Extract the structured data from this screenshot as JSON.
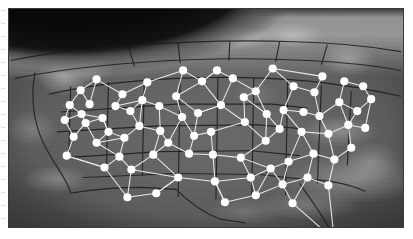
{
  "figure": {
    "kind": "satellite-map-with-network-overlay",
    "frame": {
      "x": 8,
      "y": 8,
      "width": 396,
      "height": 220,
      "border_color": "#3a3a3a"
    },
    "basemap": {
      "style": "grayscale satellite photo of North America on the curved globe limb",
      "space_color": "#0a0a0a",
      "ocean_color": "#3f3f3f",
      "land_color": "#646464",
      "snow_cloud_color": "#d8d8d8",
      "border_line_color": "#1c1c1c",
      "has_state_boundaries": true,
      "has_country_boundaries": true
    },
    "overlay": {
      "node_color": "#ffffff",
      "node_radius": 4.1,
      "link_color": "#f2f2f2",
      "link_width": 1.05,
      "node_count": 78,
      "link_count": 118
    }
  },
  "chart_data": {
    "type": "scatter",
    "title": "",
    "xlabel": "",
    "ylabel": "",
    "xlim": [
      0,
      396
    ],
    "ylim": [
      0,
      220
    ],
    "grid": false,
    "legend": "none",
    "nodes": [
      {
        "id": 0,
        "x": 170,
        "y": 170
      },
      {
        "id": 1,
        "x": 207,
        "y": 174
      },
      {
        "id": 2,
        "x": 148,
        "y": 186
      },
      {
        "id": 3,
        "x": 119,
        "y": 190
      },
      {
        "id": 4,
        "x": 123,
        "y": 162
      },
      {
        "id": 5,
        "x": 145,
        "y": 147
      },
      {
        "id": 6,
        "x": 111,
        "y": 149
      },
      {
        "id": 7,
        "x": 96,
        "y": 160
      },
      {
        "id": 8,
        "x": 88,
        "y": 135
      },
      {
        "id": 9,
        "x": 116,
        "y": 130
      },
      {
        "id": 10,
        "x": 131,
        "y": 118
      },
      {
        "id": 11,
        "x": 152,
        "y": 123
      },
      {
        "id": 12,
        "x": 151,
        "y": 98
      },
      {
        "id": 13,
        "x": 174,
        "y": 109
      },
      {
        "id": 14,
        "x": 203,
        "y": 124
      },
      {
        "id": 15,
        "x": 205,
        "y": 147
      },
      {
        "id": 16,
        "x": 233,
        "y": 150
      },
      {
        "id": 17,
        "x": 243,
        "y": 170
      },
      {
        "id": 18,
        "x": 217,
        "y": 195
      },
      {
        "id": 19,
        "x": 248,
        "y": 188
      },
      {
        "id": 20,
        "x": 275,
        "y": 177
      },
      {
        "id": 21,
        "x": 281,
        "y": 154
      },
      {
        "id": 22,
        "x": 258,
        "y": 133
      },
      {
        "id": 23,
        "x": 237,
        "y": 114
      },
      {
        "id": 24,
        "x": 213,
        "y": 97
      },
      {
        "id": 25,
        "x": 194,
        "y": 73
      },
      {
        "id": 26,
        "x": 175,
        "y": 62
      },
      {
        "id": 27,
        "x": 139,
        "y": 74
      },
      {
        "id": 28,
        "x": 114,
        "y": 86
      },
      {
        "id": 29,
        "x": 94,
        "y": 110
      },
      {
        "id": 30,
        "x": 77,
        "y": 115
      },
      {
        "id": 31,
        "x": 65,
        "y": 129
      },
      {
        "id": 32,
        "x": 58,
        "y": 148
      },
      {
        "id": 33,
        "x": 72,
        "y": 82
      },
      {
        "id": 34,
        "x": 88,
        "y": 71
      },
      {
        "id": 35,
        "x": 61,
        "y": 97
      },
      {
        "id": 36,
        "x": 73,
        "y": 106
      },
      {
        "id": 37,
        "x": 107,
        "y": 98
      },
      {
        "id": 38,
        "x": 122,
        "y": 103
      },
      {
        "id": 39,
        "x": 168,
        "y": 88
      },
      {
        "id": 40,
        "x": 190,
        "y": 105
      },
      {
        "id": 41,
        "x": 225,
        "y": 70
      },
      {
        "id": 42,
        "x": 248,
        "y": 83
      },
      {
        "id": 43,
        "x": 265,
        "y": 60
      },
      {
        "id": 44,
        "x": 286,
        "y": 78
      },
      {
        "id": 45,
        "x": 276,
        "y": 102
      },
      {
        "id": 46,
        "x": 294,
        "y": 124
      },
      {
        "id": 47,
        "x": 312,
        "y": 108
      },
      {
        "id": 48,
        "x": 307,
        "y": 84
      },
      {
        "id": 49,
        "x": 332,
        "y": 94
      },
      {
        "id": 50,
        "x": 350,
        "y": 103
      },
      {
        "id": 51,
        "x": 364,
        "y": 91
      },
      {
        "id": 52,
        "x": 356,
        "y": 78
      },
      {
        "id": 53,
        "x": 337,
        "y": 73
      },
      {
        "id": 54,
        "x": 321,
        "y": 126
      },
      {
        "id": 55,
        "x": 341,
        "y": 117
      },
      {
        "id": 56,
        "x": 358,
        "y": 120
      },
      {
        "id": 57,
        "x": 306,
        "y": 146
      },
      {
        "id": 58,
        "x": 327,
        "y": 152
      },
      {
        "id": 59,
        "x": 344,
        "y": 140
      },
      {
        "id": 60,
        "x": 300,
        "y": 170
      },
      {
        "id": 61,
        "x": 321,
        "y": 178
      },
      {
        "id": 62,
        "x": 285,
        "y": 196
      },
      {
        "id": 63,
        "x": 327,
        "y": 233
      },
      {
        "id": 64,
        "x": 259,
        "y": 106
      },
      {
        "id": 65,
        "x": 236,
        "y": 89
      },
      {
        "id": 66,
        "x": 209,
        "y": 62
      },
      {
        "id": 67,
        "x": 160,
        "y": 135
      },
      {
        "id": 68,
        "x": 181,
        "y": 146
      },
      {
        "id": 69,
        "x": 186,
        "y": 128
      },
      {
        "id": 70,
        "x": 100,
        "y": 124
      },
      {
        "id": 71,
        "x": 134,
        "y": 92
      },
      {
        "id": 72,
        "x": 56,
        "y": 112
      },
      {
        "id": 73,
        "x": 81,
        "y": 96
      },
      {
        "id": 74,
        "x": 296,
        "y": 104
      },
      {
        "id": 75,
        "x": 315,
        "y": 68
      },
      {
        "id": 76,
        "x": 272,
        "y": 121
      },
      {
        "id": 77,
        "x": 263,
        "y": 161
      }
    ],
    "links": [
      [
        0,
        1
      ],
      [
        0,
        2
      ],
      [
        0,
        5
      ],
      [
        0,
        4
      ],
      [
        1,
        15
      ],
      [
        1,
        17
      ],
      [
        1,
        18
      ],
      [
        2,
        3
      ],
      [
        2,
        0
      ],
      [
        3,
        4
      ],
      [
        3,
        7
      ],
      [
        4,
        5
      ],
      [
        4,
        6
      ],
      [
        5,
        11
      ],
      [
        5,
        67
      ],
      [
        6,
        7
      ],
      [
        6,
        9
      ],
      [
        6,
        8
      ],
      [
        7,
        32
      ],
      [
        8,
        9
      ],
      [
        8,
        30
      ],
      [
        8,
        70
      ],
      [
        9,
        10
      ],
      [
        9,
        70
      ],
      [
        10,
        11
      ],
      [
        10,
        38
      ],
      [
        10,
        71
      ],
      [
        11,
        67
      ],
      [
        11,
        12
      ],
      [
        12,
        13
      ],
      [
        12,
        71
      ],
      [
        13,
        67
      ],
      [
        13,
        69
      ],
      [
        13,
        39
      ],
      [
        14,
        15
      ],
      [
        14,
        69
      ],
      [
        14,
        23
      ],
      [
        15,
        16
      ],
      [
        15,
        68
      ],
      [
        16,
        17
      ],
      [
        16,
        22
      ],
      [
        16,
        77
      ],
      [
        17,
        19
      ],
      [
        17,
        77
      ],
      [
        18,
        19
      ],
      [
        18,
        1
      ],
      [
        19,
        20
      ],
      [
        19,
        77
      ],
      [
        20,
        21
      ],
      [
        20,
        62
      ],
      [
        20,
        60
      ],
      [
        21,
        77
      ],
      [
        21,
        57
      ],
      [
        21,
        46
      ],
      [
        22,
        23
      ],
      [
        22,
        76
      ],
      [
        22,
        64
      ],
      [
        23,
        24
      ],
      [
        23,
        65
      ],
      [
        24,
        25
      ],
      [
        24,
        40
      ],
      [
        24,
        41
      ],
      [
        25,
        26
      ],
      [
        25,
        39
      ],
      [
        25,
        66
      ],
      [
        26,
        27
      ],
      [
        26,
        39
      ],
      [
        27,
        28
      ],
      [
        27,
        71
      ],
      [
        28,
        37
      ],
      [
        28,
        34
      ],
      [
        29,
        30
      ],
      [
        29,
        36
      ],
      [
        29,
        70
      ],
      [
        30,
        31
      ],
      [
        30,
        36
      ],
      [
        31,
        32
      ],
      [
        31,
        72
      ],
      [
        32,
        7
      ],
      [
        33,
        34
      ],
      [
        33,
        35
      ],
      [
        33,
        73
      ],
      [
        34,
        73
      ],
      [
        35,
        36
      ],
      [
        35,
        72
      ],
      [
        36,
        72
      ],
      [
        37,
        38
      ],
      [
        37,
        71
      ],
      [
        38,
        71
      ],
      [
        39,
        40
      ],
      [
        40,
        69
      ],
      [
        40,
        24
      ],
      [
        41,
        42
      ],
      [
        41,
        66
      ],
      [
        42,
        43
      ],
      [
        42,
        65
      ],
      [
        42,
        64
      ],
      [
        43,
        44
      ],
      [
        43,
        75
      ],
      [
        44,
        45
      ],
      [
        44,
        48
      ],
      [
        45,
        46
      ],
      [
        45,
        74
      ],
      [
        46,
        54
      ],
      [
        46,
        57
      ],
      [
        47,
        48
      ],
      [
        47,
        54
      ],
      [
        47,
        49
      ],
      [
        48,
        75
      ],
      [
        49,
        50
      ],
      [
        49,
        53
      ],
      [
        49,
        55
      ],
      [
        50,
        51
      ],
      [
        50,
        55
      ],
      [
        51,
        52
      ],
      [
        51,
        56
      ],
      [
        52,
        53
      ],
      [
        54,
        55
      ],
      [
        54,
        58
      ],
      [
        55,
        56
      ],
      [
        55,
        59
      ],
      [
        57,
        58
      ],
      [
        57,
        60
      ],
      [
        58,
        59
      ],
      [
        58,
        61
      ],
      [
        60,
        61
      ],
      [
        60,
        62
      ],
      [
        61,
        63
      ],
      [
        62,
        63
      ],
      [
        64,
        65
      ],
      [
        64,
        76
      ],
      [
        66,
        25
      ],
      [
        67,
        68
      ],
      [
        68,
        69
      ],
      [
        70,
        29
      ],
      [
        74,
        47
      ],
      [
        76,
        45
      ],
      [
        77,
        20
      ]
    ]
  }
}
